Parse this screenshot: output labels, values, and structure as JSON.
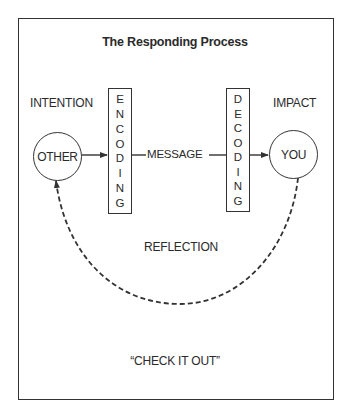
{
  "title": "The Responding Process",
  "labels": {
    "intention": "INTENTION",
    "impact": "IMPACT",
    "message": "MESSAGE",
    "reflection": "REFLECTION",
    "check_it_out": "“CHECK IT OUT”"
  },
  "nodes": {
    "other": "OTHER",
    "you": "YOU"
  },
  "encoding": {
    "word": "ENCODING",
    "letters": [
      "E",
      "N",
      "C",
      "O",
      "D",
      "I",
      "N",
      "G"
    ]
  },
  "decoding": {
    "word": "DECODING",
    "letters": [
      "D",
      "E",
      "C",
      "O",
      "D",
      "I",
      "N",
      "G"
    ]
  },
  "edges": [
    {
      "from": "OTHER",
      "to": "ENCODING",
      "style": "solid-arrow"
    },
    {
      "from": "ENCODING",
      "to": "DECODING",
      "label": "MESSAGE",
      "style": "solid"
    },
    {
      "from": "DECODING",
      "to": "YOU",
      "style": "solid-arrow"
    },
    {
      "from": "YOU",
      "to": "OTHER",
      "label": "REFLECTION",
      "style": "dashed-arrow"
    }
  ],
  "colors": {
    "stroke": "#333333",
    "text": "#2a2a2a",
    "background": "#ffffff"
  }
}
